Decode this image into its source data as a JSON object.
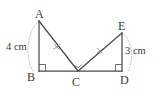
{
  "figure": {
    "background_color": "#ffffff",
    "stroke_color": "#4a4a4a",
    "guide_color": "#b8b8b8",
    "text_color": "#3b3b3b",
    "vertices": [
      {
        "id": "A",
        "label": "A",
        "x": 39,
        "y": 21
      },
      {
        "id": "B",
        "label": "B",
        "x": 39,
        "y": 71
      },
      {
        "id": "C",
        "label": "C",
        "x": 78,
        "y": 71
      },
      {
        "id": "D",
        "label": "D",
        "x": 122,
        "y": 71
      },
      {
        "id": "E",
        "label": "E",
        "x": 122,
        "y": 33
      }
    ],
    "segments": [
      {
        "name": "AB",
        "from": "A",
        "to": "B"
      },
      {
        "name": "BD",
        "from": "B",
        "to": "D"
      },
      {
        "name": "AC",
        "from": "A",
        "to": "C"
      },
      {
        "name": "CE",
        "from": "C",
        "to": "E"
      },
      {
        "name": "ED",
        "from": "E",
        "to": "D"
      }
    ],
    "measures": [
      {
        "segment": "AB",
        "value": "4 cm"
      },
      {
        "segment": "ED",
        "value": "3 cm"
      }
    ],
    "right_angles": [
      {
        "at": "B",
        "between": [
          "A",
          "C"
        ]
      },
      {
        "at": "D",
        "between": [
          "E",
          "C"
        ]
      }
    ],
    "angle_marks": [
      {
        "at": "C",
        "type": "angle-marker"
      }
    ],
    "congruence_ticks": [
      {
        "segment": "AC",
        "mark": "x",
        "x": 57,
        "y": 47
      },
      {
        "segment": "CE",
        "mark": "x",
        "x": 100,
        "y": 51
      }
    ],
    "guide_arcs": [
      {
        "name": "arc-AB",
        "from": "A",
        "to": "B",
        "style": "dotted"
      },
      {
        "name": "arc-ED",
        "from": "E",
        "to": "D",
        "style": "dotted"
      }
    ]
  }
}
